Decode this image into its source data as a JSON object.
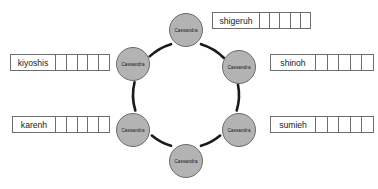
{
  "diagram": {
    "type": "cassandra-ring",
    "title": "",
    "ring": {
      "center": {
        "x": 186,
        "y": 95
      },
      "radius": 53,
      "edge_color": "#1a1a1a",
      "edge_width": 2.6,
      "node": {
        "label": "Cassandra",
        "fill_color": "#b3b3b3",
        "stroke_color": "#6b6b6b",
        "radius": 16.5,
        "count": 6
      },
      "nodes": [
        {
          "id": "node-top",
          "label": "Cassandra",
          "x": 186,
          "y": 30
        },
        {
          "id": "node-upper-right",
          "label": "Cassandra",
          "x": 239,
          "y": 67
        },
        {
          "id": "node-lower-right",
          "label": "Cassandra",
          "x": 239,
          "y": 130
        },
        {
          "id": "node-bottom",
          "label": "Cassandra",
          "x": 186,
          "y": 161
        },
        {
          "id": "node-lower-left",
          "label": "Cassandra",
          "x": 133,
          "y": 130
        },
        {
          "id": "node-upper-left",
          "label": "Cassandra",
          "x": 133,
          "y": 64
        }
      ]
    },
    "row_boxes": [
      {
        "id": "row-kiyoshis",
        "key": "kiyoshis",
        "cells": 5,
        "x": 10,
        "y": 54,
        "width": 100,
        "key_width": 45
      },
      {
        "id": "row-karenh",
        "key": "karenh",
        "cells": 5,
        "x": 12,
        "y": 116,
        "width": 98,
        "key_width": 43
      },
      {
        "id": "row-shigeruh",
        "key": "shigeruh",
        "cells": 5,
        "x": 212,
        "y": 12,
        "width": 99,
        "key_width": 47
      },
      {
        "id": "row-shinoh",
        "key": "shinoh",
        "cells": 5,
        "x": 270,
        "y": 54,
        "width": 104,
        "key_width": 45
      },
      {
        "id": "row-sumieh",
        "key": "sumieh",
        "cells": 5,
        "x": 270,
        "y": 116,
        "width": 104,
        "key_width": 45
      }
    ]
  }
}
